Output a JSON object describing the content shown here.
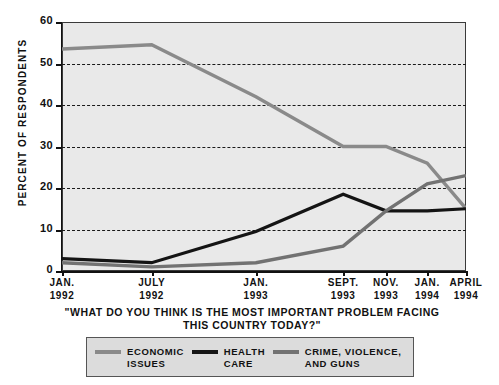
{
  "chart_data": {
    "type": "line",
    "title": "",
    "subtitle": "\"WHAT DO YOU THINK IS THE MOST IMPORTANT PROBLEM FACING THIS COUNTRY TODAY?\"",
    "caption_line1": "\"WHAT DO YOU THINK IS THE MOST IMPORTANT PROBLEM",
    "caption_line2": "FACING THIS COUNTRY TODAY?\"",
    "xlabel": "",
    "ylabel": "PERCENT OF RESPONDENTS",
    "ylim": [
      0,
      60
    ],
    "yticks": [
      0,
      10,
      20,
      30,
      40,
      50,
      60
    ],
    "ytick_labels": [
      "0",
      "10",
      "20",
      "30",
      "40",
      "50",
      "60"
    ],
    "grid": true,
    "grid_style": "dashed-horizontal",
    "legend_position": "bottom",
    "categories": [
      "JAN. 1992",
      "JULY 1992",
      "JAN. 1993",
      "SEPT. 1993",
      "NOV. 1993",
      "JAN. 1994",
      "APRIL 1994"
    ],
    "category_labels": [
      {
        "l1": "JAN.",
        "l2": "1992"
      },
      {
        "l1": "JULY",
        "l2": "1992"
      },
      {
        "l1": "JAN.",
        "l2": "1993"
      },
      {
        "l1": "SEPT.",
        "l2": "1993"
      },
      {
        "l1": "NOV.",
        "l2": "1993"
      },
      {
        "l1": "JAN.",
        "l2": "1994"
      },
      {
        "l1": "APRIL",
        "l2": "1994"
      }
    ],
    "x_positions_pct": [
      0,
      22.2,
      48.0,
      69.6,
      80.2,
      90.4,
      100
    ],
    "series": [
      {
        "name": "ECONOMIC ISSUES",
        "label_line1": "ECONOMIC",
        "label_line2": "ISSUES",
        "color": "#8a8a8a",
        "width": 3.4,
        "values": [
          53.5,
          54.5,
          42.0,
          30.0,
          30.0,
          26.0,
          15.0
        ]
      },
      {
        "name": "HEALTH CARE",
        "label_line1": "HEALTH",
        "label_line2": "CARE",
        "color": "#141414",
        "width": 3.2,
        "values": [
          3.0,
          2.0,
          9.5,
          18.5,
          14.5,
          14.5,
          15.0
        ]
      },
      {
        "name": "CRIME, VIOLENCE, AND GUNS",
        "label_line1": "CRIME, VIOLENCE,",
        "label_line2": "AND GUNS",
        "color": "#727272",
        "width": 3.4,
        "values": [
          2.0,
          1.0,
          2.0,
          6.0,
          14.5,
          21.0,
          23.0
        ]
      }
    ],
    "colors": {
      "plot_background": "#e9e9e9",
      "axis": "#111111",
      "grid": "#1a1a1a",
      "legend_background": "#dcdcdc",
      "page_background": "#ffffff"
    }
  }
}
